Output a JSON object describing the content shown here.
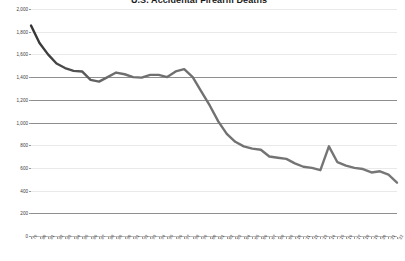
{
  "chart_data": {
    "type": "line",
    "title": "U.S. Accidental Firearm Deaths",
    "xlabel": "",
    "ylabel": "",
    "ylim": [
      0,
      2000
    ],
    "ytick_step": 200,
    "yticks": [
      0,
      200,
      400,
      600,
      800,
      1000,
      1200,
      1400,
      1600,
      1800,
      2000
    ],
    "ytick_labels": [
      "0",
      "200",
      "400",
      "600",
      "800",
      "1,000",
      "1,200",
      "1,400",
      "1,600",
      "1,800",
      "2,000"
    ],
    "grid": true,
    "grid_orientation": "horizontal",
    "dark_gridlines": [
      200,
      1000,
      1200,
      1400
    ],
    "legend": false,
    "legend_position": "none",
    "line_color": "#6f6f6f",
    "line_color_start": "#3a3a3a",
    "line_width": 2.4,
    "markers": false,
    "categories": [
      "1979",
      "1980",
      "1981",
      "1982",
      "1983",
      "1984",
      "1985",
      "1986",
      "1987",
      "1988",
      "1989",
      "1990",
      "1991",
      "1992",
      "1993",
      "1994",
      "1995",
      "1996",
      "1997",
      "1998",
      "1999",
      "2000",
      "2001",
      "2002",
      "2003",
      "2004",
      "2005",
      "2006",
      "2007",
      "2008",
      "2009",
      "2010",
      "2011",
      "2012",
      "2013",
      "2014",
      "2015",
      "2016",
      "2017",
      "2018",
      "2019",
      "2020",
      "2021",
      "2022"
    ],
    "tick_labels": [
      "'79",
      "'80",
      "'81",
      "'82",
      "'83",
      "'84",
      "'85",
      "'86",
      "'87",
      "'88",
      "'89",
      "'90",
      "'91",
      "'92",
      "'93",
      "'94",
      "'95",
      "'96",
      "'97",
      "'98",
      "'99",
      "'00",
      "'01",
      "'02",
      "'03",
      "'04",
      "'05",
      "'06",
      "'07",
      "'08",
      "'09",
      "'10",
      "'11",
      "'12",
      "'13",
      "'14",
      "'15",
      "'16",
      "'17",
      "'18",
      "'19",
      "'20",
      "'21",
      "'22"
    ],
    "series": [
      {
        "name": "Accidental firearm deaths",
        "values": [
          1855,
          1700,
          1600,
          1520,
          1480,
          1455,
          1450,
          1375,
          1360,
          1400,
          1440,
          1425,
          1400,
          1395,
          1420,
          1420,
          1400,
          1450,
          1470,
          1400,
          1275,
          1150,
          1010,
          900,
          830,
          790,
          770,
          760,
          700,
          690,
          680,
          640,
          610,
          600,
          580,
          790,
          650,
          620,
          600,
          590,
          560,
          570,
          540,
          470
        ]
      }
    ]
  }
}
